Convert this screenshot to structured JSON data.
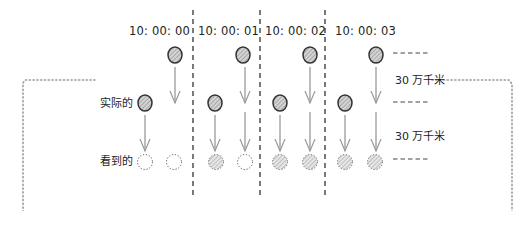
{
  "time_labels": [
    {
      "text": "10: 00: 00",
      "x": 129,
      "y": 26
    },
    {
      "text": "10: 00: 01",
      "x": 198,
      "y": 26
    },
    {
      "text": "10: 00: 02",
      "x": 265,
      "y": 26
    },
    {
      "text": "10: 00: 03",
      "x": 335,
      "y": 26
    }
  ],
  "row_labels": {
    "actual": {
      "text": "实际的",
      "x": 100,
      "y": 98
    },
    "seen": {
      "text": "看到的",
      "x": 100,
      "y": 156
    }
  },
  "distance_labels": [
    {
      "text": "30 万千米",
      "x": 395,
      "y": 75
    },
    {
      "text": "30 万千米",
      "x": 395,
      "y": 131
    }
  ],
  "colors": {
    "ink": "#333333",
    "circle_fill": "#c8c8c8",
    "hatch": "#888888",
    "arrow": "#9a9a9a",
    "dotted": "#999999"
  },
  "separators_x": [
    193,
    260,
    325
  ],
  "objects": [
    {
      "kind": "solid",
      "x": 175,
      "y": 55
    },
    {
      "kind": "solid",
      "x": 145,
      "y": 103
    },
    {
      "kind": "solid",
      "x": 243,
      "y": 55
    },
    {
      "kind": "solid",
      "x": 215,
      "y": 103
    },
    {
      "kind": "solid",
      "x": 310,
      "y": 55
    },
    {
      "kind": "solid",
      "x": 280,
      "y": 103
    },
    {
      "kind": "solid",
      "x": 376,
      "y": 55
    },
    {
      "kind": "solid",
      "x": 345,
      "y": 103
    }
  ],
  "seen": [
    {
      "kind": "empty",
      "x": 145,
      "y": 162
    },
    {
      "kind": "empty",
      "x": 174,
      "y": 162
    },
    {
      "kind": "faded",
      "x": 216,
      "y": 162
    },
    {
      "kind": "empty",
      "x": 245,
      "y": 162
    },
    {
      "kind": "faded",
      "x": 280,
      "y": 162
    },
    {
      "kind": "faded",
      "x": 310,
      "y": 162
    },
    {
      "kind": "faded",
      "x": 345,
      "y": 162
    },
    {
      "kind": "faded",
      "x": 375,
      "y": 162
    }
  ],
  "arrows": [
    {
      "x": 175,
      "y1": 67,
      "y2": 103
    },
    {
      "x": 145,
      "y1": 115,
      "y2": 151
    },
    {
      "x": 215,
      "y1": 115,
      "y2": 151
    },
    {
      "x": 245,
      "y1": 67,
      "y2": 103
    },
    {
      "x": 245,
      "y1": 112,
      "y2": 151
    },
    {
      "x": 280,
      "y1": 115,
      "y2": 151
    },
    {
      "x": 310,
      "y1": 67,
      "y2": 103
    },
    {
      "x": 310,
      "y1": 112,
      "y2": 151
    },
    {
      "x": 345,
      "y1": 115,
      "y2": 151
    },
    {
      "x": 376,
      "y1": 67,
      "y2": 103
    },
    {
      "x": 376,
      "y1": 112,
      "y2": 151
    }
  ],
  "level_marks_y": [
    53,
    102,
    159
  ]
}
